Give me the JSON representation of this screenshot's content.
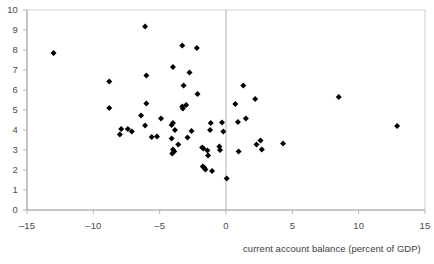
{
  "chart_data": {
    "type": "scatter",
    "title": "",
    "subtitle": "",
    "xlabel": "current account balance (percent of GDP)",
    "ylabel": "",
    "xlim": [
      -15,
      15
    ],
    "ylim": [
      0,
      10
    ],
    "xticks": [
      -15,
      -10,
      -5,
      0,
      5,
      10,
      15
    ],
    "xtick_labels": [
      "–15",
      "–10",
      "–5",
      "0",
      "5",
      "10",
      "15"
    ],
    "yticks": [
      0,
      1,
      2,
      3,
      4,
      5,
      6,
      7,
      8,
      9,
      10
    ],
    "ytick_labels": [
      "0",
      "1",
      "2",
      "3",
      "4",
      "5",
      "6",
      "7",
      "8",
      "9",
      "10"
    ],
    "grid": false,
    "legend": null,
    "marker": "diamond",
    "marker_color": "#000000",
    "annotations": [
      {
        "name": "zero-reference-line",
        "type": "vline",
        "x": 0
      }
    ],
    "series": [
      {
        "name": "countries",
        "points": [
          [
            -13.0,
            7.85
          ],
          [
            -8.8,
            6.42
          ],
          [
            -8.8,
            5.1
          ],
          [
            -7.9,
            4.05
          ],
          [
            -8.0,
            3.78
          ],
          [
            -7.4,
            4.05
          ],
          [
            -7.1,
            3.92
          ],
          [
            -6.4,
            4.72
          ],
          [
            -6.1,
            9.18
          ],
          [
            -6.0,
            6.72
          ],
          [
            -6.0,
            5.32
          ],
          [
            -6.1,
            4.22
          ],
          [
            -5.6,
            3.65
          ],
          [
            -5.2,
            3.68
          ],
          [
            -4.9,
            4.57
          ],
          [
            -4.0,
            7.15
          ],
          [
            -4.0,
            4.35
          ],
          [
            -4.1,
            4.25
          ],
          [
            -4.1,
            3.58
          ],
          [
            -4.0,
            3.02
          ],
          [
            -4.05,
            2.82
          ],
          [
            -3.9,
            2.92
          ],
          [
            -3.85,
            4.0
          ],
          [
            -3.6,
            3.28
          ],
          [
            -3.3,
            8.22
          ],
          [
            -3.2,
            6.22
          ],
          [
            -3.25,
            5.08
          ],
          [
            -3.3,
            5.18
          ],
          [
            -3.0,
            5.25
          ],
          [
            -2.9,
            3.62
          ],
          [
            -2.75,
            6.88
          ],
          [
            -2.6,
            3.95
          ],
          [
            -2.2,
            8.1
          ],
          [
            -2.15,
            5.8
          ],
          [
            -1.8,
            3.12
          ],
          [
            -1.7,
            3.08
          ],
          [
            -1.75,
            2.18
          ],
          [
            -1.65,
            2.12
          ],
          [
            -1.55,
            2.02
          ],
          [
            -1.4,
            2.98
          ],
          [
            -1.35,
            2.72
          ],
          [
            -1.15,
            4.35
          ],
          [
            -1.2,
            4.0
          ],
          [
            -1.05,
            1.95
          ],
          [
            -0.5,
            3.18
          ],
          [
            -0.45,
            3.0
          ],
          [
            -0.3,
            4.38
          ],
          [
            -0.2,
            3.92
          ],
          [
            0.05,
            1.58
          ],
          [
            0.7,
            5.3
          ],
          [
            0.9,
            4.4
          ],
          [
            0.95,
            2.93
          ],
          [
            1.3,
            6.22
          ],
          [
            1.5,
            4.58
          ],
          [
            2.2,
            5.55
          ],
          [
            2.3,
            3.28
          ],
          [
            2.6,
            3.48
          ],
          [
            2.7,
            3.03
          ],
          [
            4.3,
            3.32
          ],
          [
            8.5,
            5.65
          ],
          [
            12.9,
            4.2
          ]
        ]
      }
    ]
  }
}
